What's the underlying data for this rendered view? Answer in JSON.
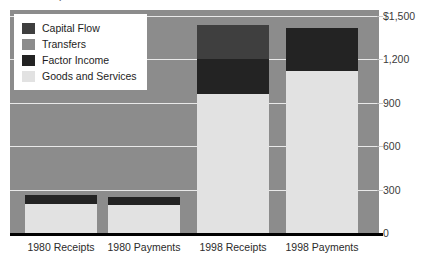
{
  "caption": "Balance of Payments",
  "chart_data": {
    "type": "bar",
    "title": "Balance of Payments",
    "xlabel": "",
    "ylabel": "",
    "stacked": true,
    "grid": true,
    "legend_position": "top-left",
    "ylim": [
      0,
      1500
    ],
    "yticks": [
      0,
      300,
      600,
      900,
      1200,
      1500
    ],
    "ytick_labels": [
      "0",
      "300",
      "600",
      "900",
      "1,200",
      "$1,500"
    ],
    "categories": [
      "1980 Receipts",
      "1980 Payments",
      "1998 Receipts",
      "1998 Payments"
    ],
    "series": [
      {
        "name": "Goods and Services",
        "color": "#e2e2e2",
        "values": [
          200,
          195,
          960,
          1120
        ]
      },
      {
        "name": "Factor Income",
        "color": "#232323",
        "values": [
          65,
          55,
          240,
          300
        ]
      },
      {
        "name": "Transfers",
        "color": "#8c8c8c",
        "values": [
          0,
          15,
          0,
          0
        ]
      },
      {
        "name": "Capital Flow",
        "color": "#3f3f3f",
        "values": [
          0,
          0,
          240,
          0
        ]
      }
    ],
    "stack_order": [
      "Goods and Services",
      "Factor Income",
      "Transfers",
      "Capital Flow"
    ]
  },
  "legend": {
    "items": [
      {
        "label": "Capital Flow",
        "color": "#3f3f3f"
      },
      {
        "label": "Transfers",
        "color": "#8c8c8c"
      },
      {
        "label": "Factor Income",
        "color": "#232323"
      },
      {
        "label": "Goods and Services",
        "color": "#e2e2e2"
      }
    ]
  },
  "colors": {
    "plot_background": "#8c8c8c",
    "gridline": "#e9e9e9",
    "axis_line": "#000000",
    "page_background": "#ffffff"
  }
}
